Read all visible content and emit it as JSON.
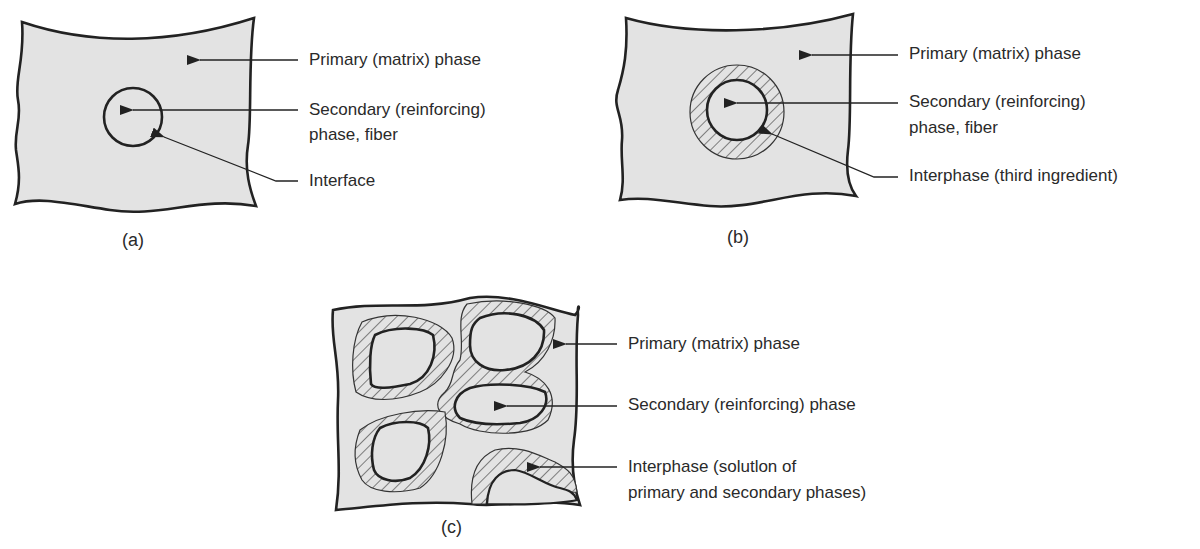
{
  "colors": {
    "matrix_fill": "#e3e3e3",
    "outline": "#222222",
    "hatch": "#444444",
    "text": "#2a2a2a",
    "background": "#ffffff"
  },
  "panels": [
    {
      "id": "a",
      "caption": "(a)",
      "labels": [
        {
          "text": "Primary (matrix) phase"
        },
        {
          "text": "Secondary (reinforcing)"
        },
        {
          "text": "phase, fiber"
        },
        {
          "text": "Interface"
        }
      ]
    },
    {
      "id": "b",
      "caption": "(b)",
      "labels": [
        {
          "text": "Primary (matrix) phase"
        },
        {
          "text": "Secondary (reinforcing)"
        },
        {
          "text": "phase, fiber"
        },
        {
          "text": "Interphase (third ingredient)"
        }
      ]
    },
    {
      "id": "c",
      "caption": "(c)",
      "labels": [
        {
          "text": "Primary (matrix) phase"
        },
        {
          "text": "Secondary (reinforcing) phase"
        },
        {
          "text": "Interphase (solutlon of"
        },
        {
          "text": "primary and secondary phases)"
        }
      ]
    }
  ]
}
